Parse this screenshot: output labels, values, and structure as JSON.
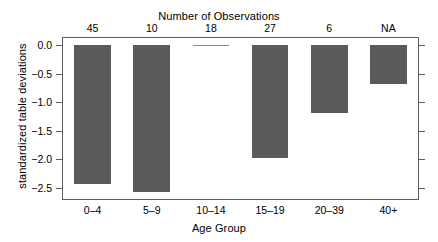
{
  "chart_data": {
    "type": "bar",
    "title": "",
    "categories": [
      "0–4",
      "5–9",
      "10–14",
      "15–19",
      "20–39",
      "40+"
    ],
    "values": [
      -2.43,
      -2.57,
      0.0,
      -1.98,
      -1.18,
      -0.68
    ],
    "series": [
      {
        "name": "standardized table deviations",
        "values": [
          -2.43,
          -2.57,
          0.0,
          -1.98,
          -1.18,
          -0.68
        ]
      }
    ],
    "xlabel": "Age Group",
    "ylabel": "standardized table deviations",
    "top_axis_label": "Number of Observations",
    "top_axis_values": [
      "45",
      "10",
      "18",
      "27",
      "6",
      "NA"
    ],
    "ylim": [
      -2.7,
      0.13
    ],
    "yticks": [
      0.0,
      -0.5,
      -1.0,
      -1.5,
      -2.0,
      -2.5
    ],
    "ytick_labels": [
      "0.0",
      "−0.5",
      "−1.0",
      "−1.5",
      "−2.0",
      "−2.5"
    ],
    "grid": false,
    "legend": null,
    "bar_color": "#5a5a5a",
    "frame_color": "#5e5e5e",
    "background": "#ffffff"
  }
}
